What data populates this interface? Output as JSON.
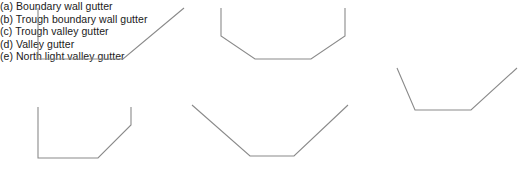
{
  "figure": {
    "background_color": "#ffffff",
    "line_color": "#8a8a8a",
    "text_color": "#1a1a1a",
    "panels": [
      {
        "key": "a",
        "caption": "(a) Boundary wall gutter",
        "shape_name": "boundary-wall-gutter-profile",
        "description": "Vertical left wall, flat base, diagonal rising to the right",
        "viewbox": "0 0 150 56",
        "points": "2,2 2,53 87,53 148,2"
      },
      {
        "key": "b",
        "caption": "(b) Trough boundary wall gutter",
        "shape_name": "trough-boundary-wall-gutter-profile",
        "description": "Vertical left wall, flat base, diagonal rising to the right, short vertical riser at top right",
        "viewbox": "0 0 110 56",
        "points": "2,2 2,53 62,53 95,20 95,2"
      },
      {
        "key": "c",
        "caption": "(c) Trough valley gutter",
        "shape_name": "trough-valley-gutter-profile",
        "description": "Short verticals both sides, sloping sides converging to a wide flat base",
        "viewbox": "0 0 128 56",
        "points": "2,2 2,30 36,53 92,53 126,30 126,2"
      },
      {
        "key": "d",
        "caption": "(d) Valley gutter",
        "shape_name": "valley-gutter-profile",
        "description": "Wide V profile with a short flat base",
        "viewbox": "0 0 160 56",
        "points": "2,2 60,53 104,53 158,2"
      },
      {
        "key": "e",
        "caption": "(e) North light valley gutter",
        "shape_name": "north-light-valley-gutter-profile",
        "description": "Asymmetric valley: steep left slope, shallow long right slope, flat base",
        "viewbox": "0 0 136 50",
        "points": "14,2 32,44 88,44 134,2"
      }
    ]
  }
}
